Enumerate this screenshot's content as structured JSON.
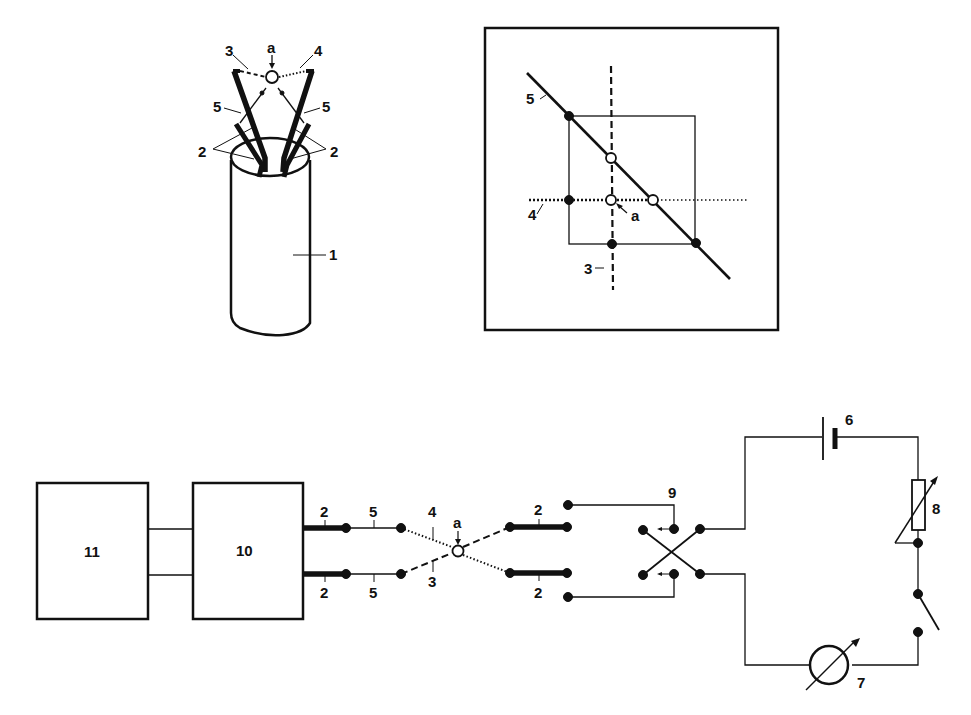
{
  "figure": {
    "type": "patent-technical-drawing",
    "panels": [
      "probe-perspective",
      "crossing-detail",
      "measurement-circuit"
    ]
  },
  "probe_view": {
    "labels": {
      "body": "1",
      "conductor_left": "2",
      "conductor_right": "2",
      "wire_dashed": "3",
      "wire_dotted": "4",
      "wire_left": "5",
      "wire_right": "5",
      "junction": "a"
    }
  },
  "crossing_view": {
    "labels": {
      "diagonal": "5",
      "dotted_line": "4",
      "dashed_line": "3",
      "junction": "a"
    }
  },
  "circuit": {
    "blocks": [
      {
        "id": "block-11",
        "label": "11"
      },
      {
        "id": "block-10",
        "label": "10"
      }
    ],
    "labels": {
      "lead_top_2": "2",
      "lead_bottom_2": "2",
      "wire_top_5": "5",
      "wire_bottom_5": "5",
      "wire_dotted_4": "4",
      "wire_dashed_3": "3",
      "junction": "a",
      "right_lead_top_2": "2",
      "right_lead_bottom_2": "2",
      "switch": "9",
      "battery": "6",
      "variable_resistor": "8",
      "meter": "7"
    }
  }
}
